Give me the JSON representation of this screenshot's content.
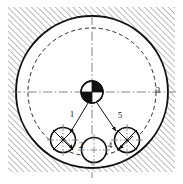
{
  "diagram": {
    "canvas": {
      "width": 183,
      "height": 184,
      "background": "#ffffff"
    },
    "colors": {
      "line": "#111111",
      "hatch": "#6a6a6a",
      "fill_white": "#ffffff",
      "fill_black": "#111111"
    },
    "hatch_region": {
      "name": "section-hatching",
      "x": 8,
      "y": 7,
      "width": 167,
      "height": 165,
      "angle_deg": 45,
      "spacing_px": 4.2,
      "stroke_width": 0.9
    },
    "housing_bore": {
      "name": "housing-bore-circle",
      "cx": 92,
      "cy": 92,
      "r": 76,
      "stroke_width": 1.8,
      "style": "solid"
    },
    "pitch_circle": {
      "name": "pitch-circle",
      "cx": 92,
      "cy": 92,
      "r": 64,
      "stroke_width": 1.0,
      "style": "dashed",
      "dash": "4,3"
    },
    "center_hub": {
      "name": "center-hub",
      "cx": 92,
      "cy": 92,
      "r": 11,
      "stroke_width": 1.2,
      "quadrants": [
        "black",
        "black",
        "white",
        "white"
      ],
      "note": "upper-right and lower-left quadrants filled black"
    },
    "centerlines": [
      {
        "name": "horizontal-centerline",
        "x1": 12,
        "y1": 92,
        "x2": 176,
        "y2": 92,
        "style": "dash-dot"
      },
      {
        "name": "vertical-centerline",
        "x1": 92,
        "y1": 16,
        "x2": 92,
        "y2": 178,
        "style": "dash-dot"
      }
    ],
    "rollers": [
      {
        "id": "roller-left",
        "name": "roller-left",
        "cx": 63,
        "cy": 140,
        "r": 12.5,
        "crosshair": true,
        "cross_diagonal": true
      },
      {
        "id": "roller-middle",
        "name": "roller-middle",
        "cx": 94,
        "cy": 150,
        "r": 12.5,
        "crosshair": true,
        "cross_diagonal": false
      },
      {
        "id": "roller-right",
        "name": "roller-right",
        "cx": 127,
        "cy": 140,
        "r": 12.5,
        "crosshair": true,
        "cross_diagonal": true
      }
    ],
    "leaders": [
      {
        "name": "leader-1",
        "label": "1",
        "label_x": 72,
        "label_y": 115,
        "x1": 88,
        "y1": 104,
        "x2": 70,
        "y2": 133
      },
      {
        "name": "leader-2",
        "label": "2",
        "label_x": 80,
        "label_y": 146,
        "x1": 62,
        "y1": 137,
        "x2": 74,
        "y2": 148
      },
      {
        "name": "leader-3",
        "label": "3",
        "label_x": 157,
        "label_y": 91,
        "x1": 0,
        "y1": 0,
        "x2": 0,
        "y2": 0
      },
      {
        "name": "leader-4",
        "label": "4",
        "label_x": 110,
        "label_y": 146,
        "x1": 132,
        "y1": 137,
        "x2": 118,
        "y2": 148
      },
      {
        "name": "leader-5",
        "label": "5",
        "label_x": 120,
        "label_y": 116,
        "x1": 97,
        "y1": 104,
        "x2": 116,
        "y2": 131
      }
    ],
    "callout_numbers": [
      "1",
      "2",
      "3",
      "4",
      "5"
    ]
  }
}
